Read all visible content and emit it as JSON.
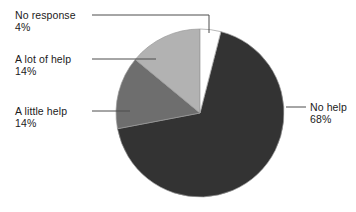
{
  "chart_data": {
    "type": "pie",
    "title": "",
    "subtitle": "",
    "xlabel": "",
    "ylabel": "",
    "grid": false,
    "legend_position": "callouts",
    "total_percent": 100,
    "categories": [
      "No help",
      "A little help",
      "A lot of help",
      "No response"
    ],
    "values": [
      68,
      14,
      14,
      4
    ],
    "slices": [
      {
        "label": "No help",
        "value": 68,
        "value_text": "68%",
        "color": "#333333",
        "start_angle_deg": 14.4,
        "end_angle_deg": 259.2,
        "callout_side": "right"
      },
      {
        "label": "A little help",
        "value": 14,
        "value_text": "14%",
        "color": "#6e6e6e",
        "start_angle_deg": 259.2,
        "end_angle_deg": 309.6,
        "callout_side": "left"
      },
      {
        "label": "A lot of help",
        "value": 14,
        "value_text": "14%",
        "color": "#b2b2b2",
        "start_angle_deg": 309.6,
        "end_angle_deg": 360.0,
        "callout_side": "left"
      },
      {
        "label": "No response",
        "value": 4,
        "value_text": "4%",
        "color": "#ffffff",
        "start_angle_deg": 0.0,
        "end_angle_deg": 14.4,
        "callout_side": "left"
      }
    ],
    "colors": {
      "no_help": "#333333",
      "a_little_help": "#6e6e6e",
      "a_lot_of_help": "#b2b2b2",
      "no_response": "#ffffff",
      "slice_outline": "#9a9a9a",
      "leader_line": "#4d4d4d",
      "text": "#1b1b1b",
      "background": "#ffffff"
    }
  },
  "callouts": {
    "no_response": {
      "name": "No response",
      "value": "4%"
    },
    "a_lot_of_help": {
      "name": "A lot of help",
      "value": "14%"
    },
    "a_little_help": {
      "name": "A little help",
      "value": "14%"
    },
    "no_help": {
      "name": "No help",
      "value": "68%"
    }
  }
}
